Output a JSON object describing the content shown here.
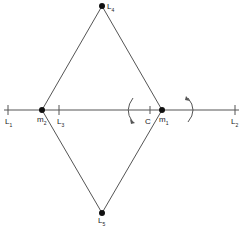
{
  "diagram": {
    "points": {
      "L4": {
        "label": "L",
        "sub": "4"
      },
      "L5": {
        "label": "L",
        "sub": "5"
      },
      "L1": {
        "label": "L",
        "sub": "1"
      },
      "L2": {
        "label": "L",
        "sub": "2"
      },
      "L3": {
        "label": "L",
        "sub": "3"
      },
      "m1": {
        "label": "m",
        "sub": "1"
      },
      "m2": {
        "label": "m",
        "sub": "2"
      },
      "C": {
        "label": "C"
      }
    },
    "colors": {
      "line": "#555555",
      "dot": "#111111"
    }
  }
}
